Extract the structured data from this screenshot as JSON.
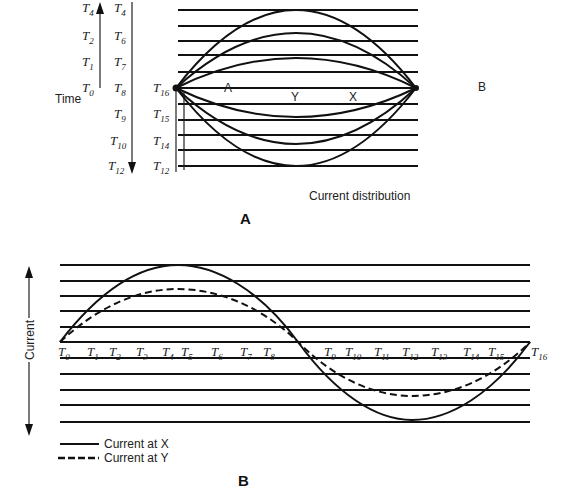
{
  "panel_a": {
    "caption": "A",
    "time_label": "Time",
    "left_column_up": [
      {
        "base": "T",
        "sub": "4"
      },
      {
        "base": "T",
        "sub": "2"
      },
      {
        "base": "T",
        "sub": "1"
      },
      {
        "base": "T",
        "sub": "0"
      }
    ],
    "left_column_down": [
      {
        "base": "T",
        "sub": "4"
      },
      {
        "base": "T",
        "sub": "6"
      },
      {
        "base": "T",
        "sub": "7"
      },
      {
        "base": "T",
        "sub": "8"
      },
      {
        "base": "T",
        "sub": "9"
      },
      {
        "base": "T",
        "sub": "10"
      },
      {
        "base": "T",
        "sub": "12"
      }
    ],
    "right_column": [
      {
        "base": "T",
        "sub": "16"
      },
      {
        "base": "T",
        "sub": "15"
      },
      {
        "base": "T",
        "sub": "14"
      },
      {
        "base": "T",
        "sub": "12"
      }
    ],
    "point_labels": {
      "a": "A",
      "y": "Y",
      "x": "X",
      "b": "B"
    },
    "footer": "Current distribution"
  },
  "panel_b": {
    "caption": "B",
    "axis_label": "Current",
    "time_labels": [
      {
        "base": "T",
        "sub": "0"
      },
      {
        "base": "T",
        "sub": "1"
      },
      {
        "base": "T",
        "sub": "2"
      },
      {
        "base": "T",
        "sub": "3"
      },
      {
        "base": "T",
        "sub": "4"
      },
      {
        "base": "T",
        "sub": "5"
      },
      {
        "base": "T",
        "sub": "6"
      },
      {
        "base": "T",
        "sub": "7"
      },
      {
        "base": "T",
        "sub": "8"
      },
      {
        "base": "T",
        "sub": "9"
      },
      {
        "base": "T",
        "sub": "10"
      },
      {
        "base": "T",
        "sub": "11"
      },
      {
        "base": "T",
        "sub": "12"
      },
      {
        "base": "T",
        "sub": "13"
      },
      {
        "base": "T",
        "sub": "14"
      },
      {
        "base": "T",
        "sub": "15"
      },
      {
        "base": "T",
        "sub": "16"
      }
    ],
    "legend": [
      {
        "style": "solid",
        "label": "Current at X"
      },
      {
        "style": "dashed",
        "label": "Current at Y"
      }
    ]
  }
}
